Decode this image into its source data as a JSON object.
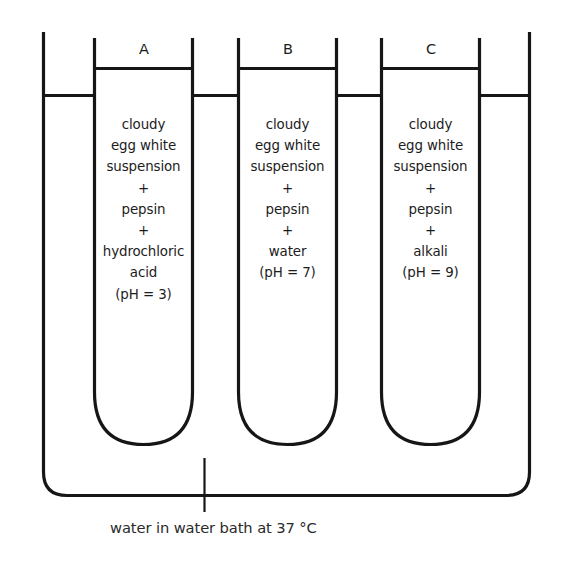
{
  "figure": {
    "kind": "science-diagram",
    "colors": {
      "stroke": "#161616",
      "background": "#ffffff",
      "text": "#1c1c1c"
    }
  },
  "tubes": [
    {
      "label": "A",
      "contents": [
        "cloudy",
        "egg white",
        "suspension",
        "+",
        "pepsin",
        "+",
        "hydrochloric",
        "acid",
        "(pH = 3)"
      ],
      "ph": "3",
      "variable": "hydrochloric acid"
    },
    {
      "label": "B",
      "contents": [
        "cloudy",
        "egg white",
        "suspension",
        "+",
        "pepsin",
        "+",
        "water",
        "(pH = 7)"
      ],
      "ph": "7",
      "variable": "water"
    },
    {
      "label": "C",
      "contents": [
        "cloudy",
        "egg white",
        "suspension",
        "+",
        "pepsin",
        "+",
        "alkali",
        "(pH = 9)"
      ],
      "ph": "9",
      "variable": "alkali"
    }
  ],
  "caption": {
    "text": "water in water bath at 37 °C",
    "temperature": "37 °C"
  }
}
